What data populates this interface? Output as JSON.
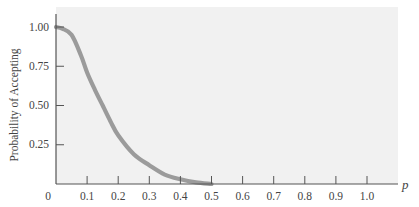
{
  "chart_data": {
    "type": "line",
    "title": "",
    "xlabel": "p",
    "ylabel": "Probability of Accepting",
    "xlim": [
      0,
      1.1
    ],
    "ylim": [
      0,
      1.05
    ],
    "grid": false,
    "legend": null,
    "x_ticks": [
      0.1,
      0.2,
      0.3,
      0.4,
      0.5,
      0.6,
      0.7,
      0.8,
      0.9,
      1.0
    ],
    "x_tick_labels": [
      "0",
      "0.1",
      "0.2",
      "0.3",
      "0.4",
      "0.5",
      "0.6",
      "0.7",
      "0.8",
      "0.9",
      "1.0"
    ],
    "y_ticks": [
      0.25,
      0.5,
      0.75,
      1.0
    ],
    "y_tick_labels": [
      "0.25",
      "0.50",
      "0.75",
      "1.00"
    ],
    "series": [
      {
        "name": "OC curve",
        "color": "#9b9b9b",
        "x": [
          0,
          0.02,
          0.05,
          0.08,
          0.1,
          0.125,
          0.15,
          0.175,
          0.2,
          0.25,
          0.3,
          0.35,
          0.4,
          0.45,
          0.5
        ],
        "values": [
          1.0,
          0.99,
          0.95,
          0.82,
          0.71,
          0.6,
          0.5,
          0.4,
          0.31,
          0.19,
          0.12,
          0.06,
          0.03,
          0.01,
          0.0
        ]
      }
    ]
  },
  "labels": {
    "ylabel": "Probability of Accepting",
    "xvar": "p",
    "origin": "0",
    "x_ticks": [
      "0.1",
      "0.2",
      "0.3",
      "0.4",
      "0.5",
      "0.6",
      "0.7",
      "0.8",
      "0.9",
      "1.0"
    ],
    "y_ticks": [
      "1.00",
      "0.75",
      "0.50",
      "0.25"
    ]
  },
  "colors": {
    "panel": "#f1f1f1",
    "curve": "#9b9b9b",
    "axis": "#555555"
  }
}
